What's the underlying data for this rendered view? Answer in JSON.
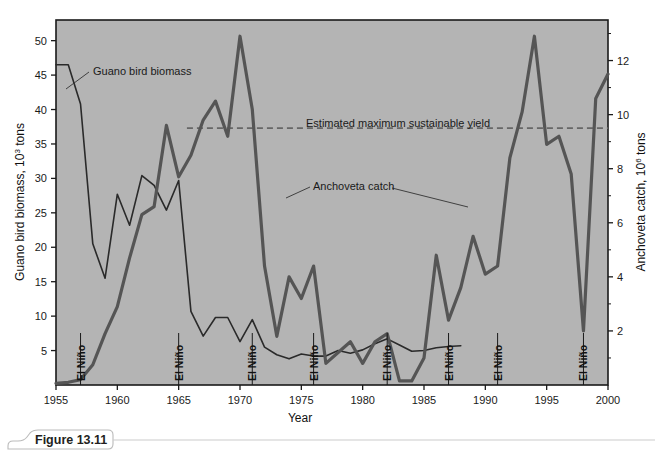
{
  "figure": {
    "caption_label": "Figure 13.11"
  },
  "chart_data": {
    "type": "line",
    "title": "",
    "xlabel": "Year",
    "ylabel": "Guano bird biomass, 10³ tons",
    "y2label": "Anchoveta catch, 10⁶ tons",
    "xlim": [
      1955,
      2000
    ],
    "ylim": [
      0,
      53
    ],
    "y2lim": [
      0,
      13.5
    ],
    "grid": false,
    "plot_background": "#b4b4b4",
    "xticks": [
      1955,
      1960,
      1965,
      1970,
      1975,
      1980,
      1985,
      1990,
      1995,
      2000
    ],
    "xtick_labels": [
      "1955",
      "1960",
      "1965",
      "1970",
      "1975",
      "1980",
      "1985",
      "1990",
      "1995",
      "2000"
    ],
    "yticks": [
      5,
      10,
      15,
      20,
      25,
      30,
      35,
      40,
      45,
      50
    ],
    "ytick_labels": [
      "5",
      "10",
      "15",
      "20",
      "25",
      "30",
      "35",
      "40",
      "45",
      "50"
    ],
    "y2ticks": [
      2,
      4,
      6,
      8,
      10,
      12
    ],
    "y2tick_labels": [
      "2",
      "4",
      "6",
      "8",
      "10",
      "12"
    ],
    "y_axis_label_prefix": "Guano bird biomass, 10",
    "y_axis_label_exponent": "3",
    "y_axis_label_suffix": " tons",
    "y2_axis_label_prefix": "Anchoveta catch, 10",
    "y2_axis_label_exponent": "6",
    "y2_axis_label_suffix": " tons",
    "series": [
      {
        "name": "Guano bird biomass",
        "axis": "left",
        "color": "#2a2a2a",
        "width": 1.6,
        "style": "solid",
        "x": [
          1955,
          1956,
          1957,
          1958,
          1959,
          1960,
          1961,
          1962,
          1963,
          1964,
          1965,
          1966,
          1967,
          1968,
          1969,
          1970,
          1971,
          1972,
          1973,
          1974,
          1975,
          1976,
          1977,
          1978,
          1979,
          1980,
          1981,
          1982,
          1983,
          1984,
          1985,
          1986,
          1987,
          1988
        ],
        "values": [
          46.5,
          46.5,
          40.8,
          20.5,
          15.5,
          27.7,
          23.2,
          30.4,
          29.0,
          25.4,
          29.7,
          10.7,
          7.1,
          9.8,
          9.8,
          6.3,
          9.5,
          5.5,
          4.4,
          3.8,
          4.5,
          4.2,
          4.2,
          5.0,
          4.6,
          5.1,
          6.0,
          6.7,
          5.8,
          4.9,
          5.0,
          5.4,
          5.6,
          5.7
        ]
      },
      {
        "name": "Anchoveta catch",
        "axis": "right",
        "color": "#555555",
        "width": 3.2,
        "style": "solid",
        "x": [
          1955,
          1956,
          1957,
          1958,
          1959,
          1960,
          1961,
          1962,
          1963,
          1964,
          1965,
          1966,
          1967,
          1968,
          1969,
          1970,
          1971,
          1972,
          1973,
          1974,
          1975,
          1976,
          1977,
          1978,
          1979,
          1980,
          1981,
          1982,
          1983,
          1984,
          1985,
          1986,
          1987,
          1988,
          1989,
          1990,
          1991,
          1992,
          1993,
          1994,
          1995,
          1996,
          1997,
          1998,
          1999,
          2000
        ],
        "values": [
          0.06,
          0.1,
          0.2,
          0.75,
          1.9,
          2.9,
          4.7,
          6.3,
          6.6,
          9.6,
          7.7,
          8.5,
          9.8,
          10.5,
          9.2,
          12.9,
          10.2,
          4.4,
          1.8,
          4.0,
          3.2,
          4.4,
          0.8,
          1.2,
          1.6,
          0.8,
          1.6,
          1.9,
          0.15,
          0.15,
          1.0,
          4.8,
          2.4,
          3.6,
          5.5,
          4.1,
          4.4,
          8.4,
          10.1,
          12.9,
          8.9,
          9.2,
          7.8,
          2.0,
          10.6,
          11.5
        ]
      }
    ],
    "reference_line": {
      "name": "Estimated maximum sustainable yield",
      "axis": "right",
      "value": 9.5,
      "style": "dashed",
      "color": "#666666",
      "label": "Estimated maximum sustainable yield"
    },
    "annotations": [
      {
        "name": "guano-bird-biomass-label",
        "text": "Guano bird biomass",
        "x_px": 93,
        "y_px": 75
      },
      {
        "name": "anchoveta-catch-label",
        "text": "Anchoveta catch",
        "x_px": 313,
        "y_px": 190
      },
      {
        "name": "msy-label",
        "text": "Estimated maximum sustainable yield",
        "x_px": 306,
        "y_px": 127
      }
    ],
    "event_markers": {
      "label": "El Niño",
      "years": [
        1957,
        1965,
        1971,
        1976,
        1982,
        1987,
        1991,
        1998
      ]
    }
  }
}
